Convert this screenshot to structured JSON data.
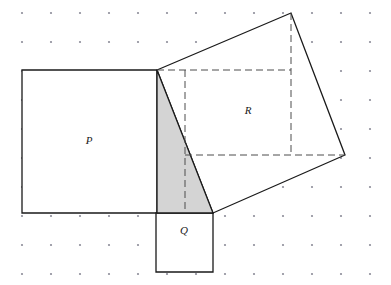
{
  "figure": {
    "title": "Geometric dot-grid figure with three squares and a right triangle",
    "canvas": {
      "width": 391,
      "height": 285,
      "background": "#ffffff"
    },
    "grid": {
      "name": "dot-grid",
      "origin_x": 22,
      "origin_y": 13,
      "spacing": 29,
      "cols": 13,
      "rows": 10,
      "dot_radius": 1.1,
      "color": "#8c8c99"
    },
    "style": {
      "stroke": "#1a1a1a",
      "stroke_width": 1.3,
      "shaded_fill": "#d4d4d4",
      "unshaded_fill": "#ffffff",
      "dash_color": "#4d4d4d",
      "dash_pattern": "7 4"
    },
    "shapes": [
      {
        "id": "square-p",
        "label": "P",
        "label_x": 89,
        "label_y": 144,
        "filled": false,
        "points": "22,70 157,70 157,213 22,213"
      },
      {
        "id": "square-q",
        "label": "Q",
        "label_x": 184,
        "label_y": 234,
        "filled": false,
        "points": "156,213 213,213 213,272 156,272"
      },
      {
        "id": "square-r",
        "label": "R",
        "label_x": 248,
        "label_y": 114,
        "filled": false,
        "points": "157,70 291,13 345,155 213,213"
      },
      {
        "id": "triangle-shaded",
        "label": "",
        "label_x": 0,
        "label_y": 0,
        "filled": true,
        "points": "157,70 213,213 157,213"
      }
    ],
    "dashed_lines": [
      {
        "id": "dash-top",
        "x1": 157,
        "y1": 70,
        "x2": 291,
        "y2": 70
      },
      {
        "id": "dash-bottom",
        "x1": 185,
        "y1": 155,
        "x2": 345,
        "y2": 155
      },
      {
        "id": "dash-left",
        "x1": 185,
        "y1": 70,
        "x2": 185,
        "y2": 213
      },
      {
        "id": "dash-right",
        "x1": 291,
        "y1": 13,
        "x2": 291,
        "y2": 155
      }
    ]
  }
}
